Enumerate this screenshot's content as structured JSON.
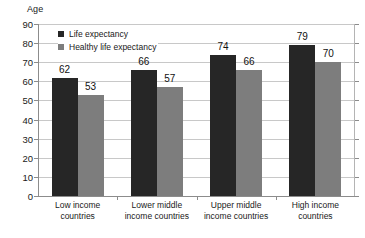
{
  "chart_data": {
    "type": "bar",
    "title": "",
    "subtitle": "",
    "xlabel": "",
    "ylabel": "Age",
    "ylim": [
      0,
      90
    ],
    "ytick_step": 10,
    "yticks": [
      90,
      80,
      70,
      60,
      50,
      40,
      30,
      20,
      10,
      0
    ],
    "grid": true,
    "legend_position": "top-left-inside",
    "categories": [
      "Low income countries",
      "Lower middle income countries",
      "Upper middle income countries",
      "High income countries"
    ],
    "category_lines": [
      [
        "Low income",
        "countries"
      ],
      [
        "Lower middle",
        "income countries"
      ],
      [
        "Upper middle",
        "income countries"
      ],
      [
        "High income",
        "countries"
      ]
    ],
    "series": [
      {
        "name": "Life expectancy",
        "color": "#262626",
        "values": [
          62,
          66,
          74,
          79
        ]
      },
      {
        "name": "Healthy life expectancy",
        "color": "#7d7d7d",
        "values": [
          53,
          57,
          66,
          70
        ]
      }
    ]
  },
  "colors": {
    "background": "#ffffff",
    "gridline": "#c8c8c8",
    "axis": "#8c8c8c",
    "text": "#1a1a1a",
    "series_dark": "#262626",
    "series_gray": "#7d7d7d"
  }
}
